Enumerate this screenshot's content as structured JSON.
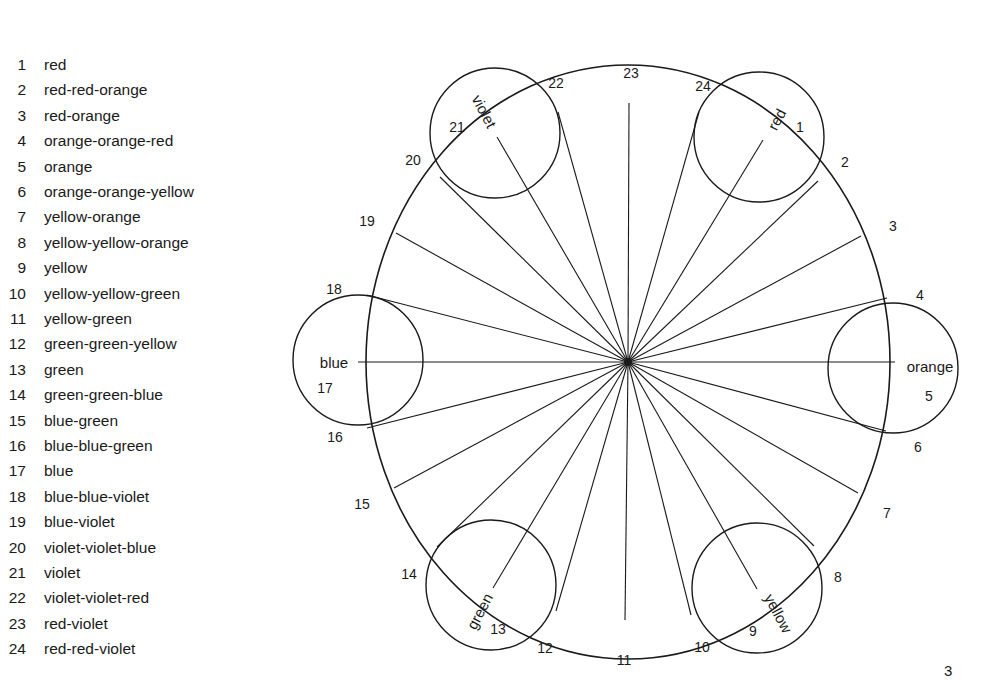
{
  "legend": {
    "items": [
      {
        "num": "1",
        "name": "red"
      },
      {
        "num": "2",
        "name": "red-red-orange"
      },
      {
        "num": "3",
        "name": "red-orange"
      },
      {
        "num": "4",
        "name": "orange-orange-red"
      },
      {
        "num": "5",
        "name": "orange"
      },
      {
        "num": "6",
        "name": "orange-orange-yellow"
      },
      {
        "num": "7",
        "name": "yellow-orange"
      },
      {
        "num": "8",
        "name": "yellow-yellow-orange"
      },
      {
        "num": "9",
        "name": "yellow"
      },
      {
        "num": "10",
        "name": "yellow-yellow-green"
      },
      {
        "num": "11",
        "name": "yellow-green"
      },
      {
        "num": "12",
        "name": "green-green-yellow"
      },
      {
        "num": "13",
        "name": "green"
      },
      {
        "num": "14",
        "name": "green-green-blue"
      },
      {
        "num": "15",
        "name": "blue-green"
      },
      {
        "num": "16",
        "name": "blue-blue-green"
      },
      {
        "num": "17",
        "name": "blue"
      },
      {
        "num": "18",
        "name": "blue-blue-violet"
      },
      {
        "num": "19",
        "name": "blue-violet"
      },
      {
        "num": "20",
        "name": "violet-violet-blue"
      },
      {
        "num": "21",
        "name": "violet"
      },
      {
        "num": "22",
        "name": "violet-violet-red"
      },
      {
        "num": "23",
        "name": "red-violet"
      },
      {
        "num": "24",
        "name": "red-red-violet"
      }
    ]
  },
  "wheel": {
    "center": [
      628,
      362
    ],
    "radius_x": 262,
    "radius_y": 297,
    "spokes": [
      {
        "num": "1",
        "end": [
          763,
          140
        ],
        "label_pos": [
          800,
          128
        ]
      },
      {
        "num": "2",
        "end": [
          818,
          181
        ],
        "label_pos": [
          845,
          163
        ]
      },
      {
        "num": "3",
        "end": [
          861,
          236
        ],
        "label_pos": [
          893,
          227
        ]
      },
      {
        "num": "4",
        "end": [
          887,
          298
        ],
        "label_pos": [
          920,
          296
        ]
      },
      {
        "num": "5",
        "end": [
          895,
          362
        ],
        "label_pos": [
          929,
          397
        ]
      },
      {
        "num": "6",
        "end": [
          886,
          431
        ],
        "label_pos": [
          918,
          448
        ]
      },
      {
        "num": "7",
        "end": [
          858,
          493
        ],
        "label_pos": [
          887,
          514
        ]
      },
      {
        "num": "8",
        "end": [
          814,
          546
        ],
        "label_pos": [
          838,
          578
        ]
      },
      {
        "num": "9",
        "end": [
          757,
          589
        ],
        "label_pos": [
          753,
          632
        ]
      },
      {
        "num": "10",
        "end": [
          691,
          615
        ],
        "label_pos": [
          702,
          648
        ]
      },
      {
        "num": "11",
        "end": [
          625,
          620
        ],
        "label_pos": [
          624,
          661
        ]
      },
      {
        "num": "12",
        "end": [
          556,
          611
        ],
        "label_pos": [
          545,
          649
        ]
      },
      {
        "num": "13",
        "end": [
          493,
          588
        ],
        "label_pos": [
          498,
          630
        ]
      },
      {
        "num": "14",
        "end": [
          437,
          547
        ],
        "label_pos": [
          409,
          575
        ]
      },
      {
        "num": "15",
        "end": [
          394,
          488
        ],
        "label_pos": [
          362,
          505
        ]
      },
      {
        "num": "16",
        "end": [
          367,
          428
        ],
        "label_pos": [
          335,
          438
        ]
      },
      {
        "num": "17",
        "end": [
          358,
          362
        ],
        "label_pos": [
          325,
          389
        ]
      },
      {
        "num": "18",
        "end": [
          367,
          295
        ],
        "label_pos": [
          334,
          290
        ]
      },
      {
        "num": "19",
        "end": [
          396,
          233
        ],
        "label_pos": [
          367,
          222
        ]
      },
      {
        "num": "20",
        "end": [
          440,
          177
        ],
        "label_pos": [
          413,
          161
        ]
      },
      {
        "num": "21",
        "end": [
          497,
          137
        ],
        "label_pos": [
          457,
          128
        ]
      },
      {
        "num": "22",
        "end": [
          558,
          112
        ],
        "label_pos": [
          556,
          84
        ]
      },
      {
        "num": "23",
        "end": [
          629,
          103
        ],
        "label_pos": [
          631,
          74
        ]
      },
      {
        "num": "24",
        "end": [
          699,
          112
        ],
        "label_pos": [
          703,
          87
        ]
      }
    ],
    "primary_circles": [
      {
        "name": "red",
        "center": [
          759,
          137
        ],
        "r": 65,
        "text_pos": [
          778,
          120
        ],
        "rotate": -62
      },
      {
        "name": "orange",
        "center": [
          893,
          368
        ],
        "r": 65,
        "text_pos": [
          930,
          368
        ],
        "rotate": 0
      },
      {
        "name": "yellow",
        "center": [
          757,
          588
        ],
        "r": 65,
        "text_pos": [
          777,
          614
        ],
        "rotate": 62
      },
      {
        "name": "green",
        "center": [
          491,
          585
        ],
        "r": 65,
        "text_pos": [
          481,
          612
        ],
        "rotate": -62
      },
      {
        "name": "blue",
        "center": [
          358,
          360
        ],
        "r": 65,
        "text_pos": [
          334,
          364
        ],
        "rotate": 0
      },
      {
        "name": "violet",
        "center": [
          495,
          133
        ],
        "r": 65,
        "text_pos": [
          483,
          112
        ],
        "rotate": 62
      }
    ]
  },
  "page": {
    "number": "3"
  }
}
